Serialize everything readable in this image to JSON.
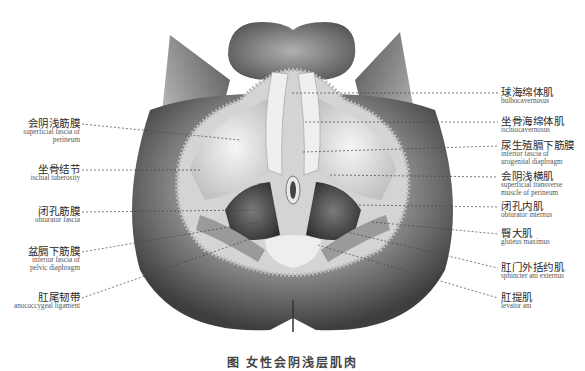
{
  "figure": {
    "caption": "图 女性会阴浅层肌肉",
    "labels_left": [
      {
        "zh": "会阴浅筋膜",
        "en": "superficial fascia of perineum"
      },
      {
        "zh": "坐骨结节",
        "en": "ischial tuberosity"
      },
      {
        "zh": "闭孔筋膜",
        "en": "obturator fascia"
      },
      {
        "zh": "盆膈下筋膜",
        "en": "inferior fascia of pelvic diaphragm"
      },
      {
        "zh": "肛尾韧带",
        "en": "anococcygeal ligament"
      }
    ],
    "labels_right": [
      {
        "zh": "球海绵体肌",
        "en": "bulbocavernosus"
      },
      {
        "zh": "坐骨海绵体肌",
        "en": "ischiocavernosus"
      },
      {
        "zh": "尿生殖膈下筋膜",
        "en": "inferior fascia of urogenital diaphragm"
      },
      {
        "zh": "会阴浅横肌",
        "en": "superficial transverse muscle of perineum"
      },
      {
        "zh": "闭孔内肌",
        "en": "obturator internus"
      },
      {
        "zh": "臀大肌",
        "en": "gluteus maximus"
      },
      {
        "zh": "肛门外括约肌",
        "en": "sphincter ani externus"
      },
      {
        "zh": "肛提肌",
        "en": "levator ani"
      }
    ]
  }
}
